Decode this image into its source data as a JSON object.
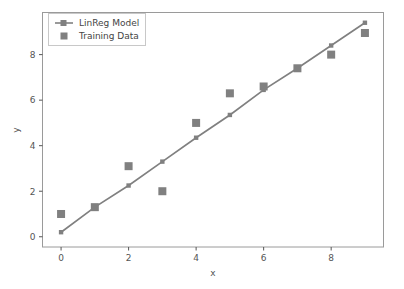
{
  "chart_data": {
    "type": "scatter",
    "title": "",
    "subtitle": "",
    "xlabel": "x",
    "ylabel": "y",
    "xlim": [
      -0.55,
      9.55
    ],
    "ylim": [
      -0.45,
      9.85
    ],
    "xticks": [
      0,
      2,
      4,
      6,
      8
    ],
    "yticks": [
      0,
      2,
      4,
      6,
      8
    ],
    "xticklabels": [
      "0",
      "2",
      "4",
      "6",
      "8"
    ],
    "yticklabels": [
      "0",
      "2",
      "4",
      "6",
      "8"
    ],
    "grid": false,
    "legend_position": "upper left",
    "series": [
      {
        "name": "LinReg Model",
        "type": "line",
        "marker": "square",
        "color": "#808080",
        "x": [
          0,
          1,
          2,
          3,
          4,
          5,
          6,
          7,
          8,
          9
        ],
        "values": [
          0.2,
          1.3,
          2.25,
          3.3,
          4.35,
          5.35,
          6.45,
          7.4,
          8.4,
          9.4
        ]
      },
      {
        "name": "Training Data",
        "type": "scatter",
        "marker": "square",
        "color": "#808080",
        "x": [
          0,
          1,
          2,
          3,
          4,
          5,
          6,
          7,
          8,
          9
        ],
        "values": [
          1.0,
          1.3,
          3.1,
          2.0,
          5.0,
          6.3,
          6.6,
          7.4,
          8.0,
          8.95
        ]
      }
    ]
  },
  "legend": {
    "entries": [
      {
        "label": "LinReg Model",
        "marker": "line-with-square-marker",
        "color": "#808080"
      },
      {
        "label": "Training Data",
        "marker": "square",
        "color": "#808080"
      }
    ]
  },
  "axes": {
    "x_title": "x",
    "y_title": "y"
  },
  "colors": {
    "series": "#808080",
    "axis": "#555555",
    "spine": "#9a9a9a",
    "background": "#ffffff",
    "legend_border": "#c8c8c8"
  }
}
